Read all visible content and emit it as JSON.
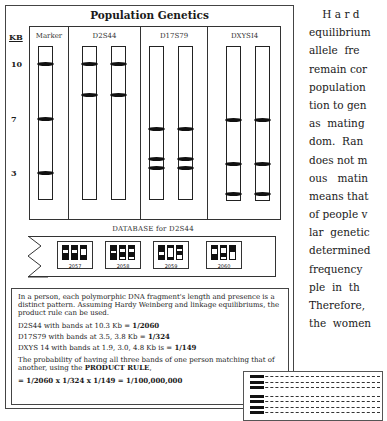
{
  "figure": {
    "title": "Population Genetics",
    "kb_header": "KB",
    "kb_labels": [
      {
        "label": "10",
        "y": 63
      },
      {
        "label": "7",
        "y": 118
      },
      {
        "label": "3",
        "y": 172
      }
    ],
    "lane_groups": [
      {
        "name": "Marker",
        "lanes": [
          {
            "bands": [
              10,
              7,
              3
            ]
          }
        ]
      },
      {
        "name": "D2S44",
        "lanes": [
          {
            "bands": [
              10,
              8.5
            ]
          },
          {
            "bands": [
              10,
              8.5
            ]
          }
        ]
      },
      {
        "name": "D17S79",
        "lanes": [
          {
            "bands": [
              4.8,
              3.8,
              3.5
            ]
          },
          {
            "bands": [
              4.8,
              3.8,
              3.5
            ]
          }
        ]
      },
      {
        "name": "DXYSI4",
        "lanes": [
          {
            "bands": [
              4.8,
              3.0,
              1.9
            ]
          },
          {
            "bands": [
              4.8,
              3.0,
              1.9
            ]
          }
        ]
      }
    ]
  },
  "database": {
    "label": "DATABASE for D2S44",
    "entries": [
      {
        "id": "2057"
      },
      {
        "id": "2058"
      },
      {
        "id": "2059"
      },
      {
        "id": "2060"
      }
    ]
  },
  "explanation": {
    "intro": "In a person, each polymorphic DNA fragment's length and presence is a distinct pattern. Assuming Hardy Weinberg and linkage equilibriums, the product rule can be used.",
    "lines": [
      {
        "text": "D2S44 with bands at 10.3 Kb = ",
        "bold": "1/2060"
      },
      {
        "text": "D17S79 with bands at 3.5, 3.8 Kb = ",
        "bold": "1/324"
      },
      {
        "text": "DXYS 14 with bands at 1.9, 3.0, 4.8 Kb is = ",
        "bold": "1/149"
      }
    ],
    "probability_text": "The probability of having all three bands of one person matching that of another, using the ",
    "rule": "PRODUCT RULE",
    "rule_suffix": ",",
    "result": "= 1/2060 x 1/324 x 1/149 = 1/100,000,000"
  },
  "prose": {
    "lines": [
      "    H a r d",
      "equilibrium",
      "allele  fre",
      "remain cor",
      "population",
      "tion to gen",
      "as  mating",
      "dom.  Ran",
      "does not m",
      "ous   matin",
      "means that",
      "of people v",
      "lar  genetic",
      "determined",
      "frequency",
      "ple  in  th",
      "Therefore,",
      "the  women"
    ]
  }
}
